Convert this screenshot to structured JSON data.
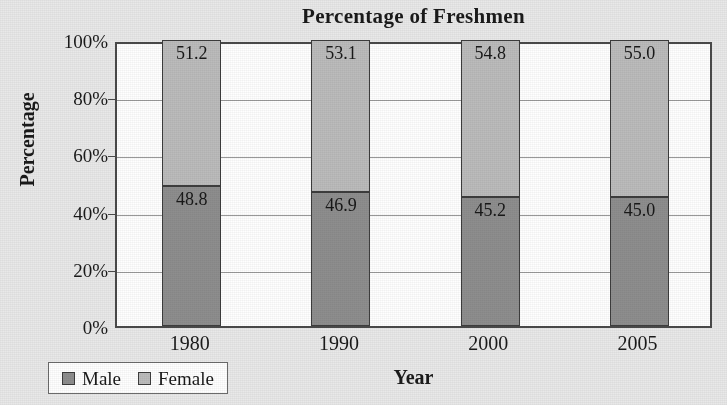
{
  "chart_data": {
    "type": "bar",
    "subtype": "stacked-percentage-column",
    "title": "Percentage of Freshmen",
    "xlabel": "Year",
    "ylabel": "Percentage",
    "categories": [
      "1980",
      "1990",
      "2000",
      "2005"
    ],
    "series": [
      {
        "name": "Male",
        "values": [
          48.8,
          46.9,
          45.2,
          45.0
        ],
        "color": "#8e8e8e"
      },
      {
        "name": "Female",
        "values": [
          51.2,
          53.1,
          54.8,
          55.0
        ],
        "color": "#bcbcbc"
      }
    ],
    "ylim": [
      0,
      100
    ],
    "yticks": [
      "0%",
      "20%",
      "40%",
      "60%",
      "80%",
      "100%"
    ],
    "ytick_values": [
      0,
      20,
      40,
      60,
      80,
      100
    ],
    "grid": true,
    "legend_position": "bottom-left",
    "data_labels": true,
    "plot_background": "#ffffff",
    "page_background": "#e9e9e9"
  }
}
